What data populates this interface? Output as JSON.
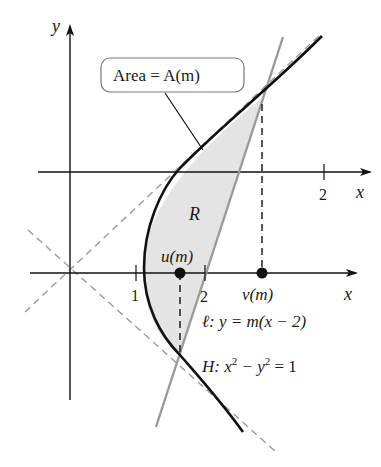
{
  "figure": {
    "axes": {
      "x_label": "x",
      "y_label": "y",
      "x_label_upper": "x"
    },
    "ticks": {
      "one": "1",
      "two": "2",
      "two_upper": "2"
    },
    "callout": {
      "text": "Area = A(m)"
    },
    "region_label": "R",
    "points": {
      "u": "u(m)",
      "v": "v(m)"
    },
    "line_label": "ℓ: y = m(x − 2)",
    "hyperbola_label": {
      "prefix": "H: x",
      "sup1": "2",
      "mid": " − y",
      "sup2": "2",
      "suffix": " = 1"
    },
    "colors": {
      "curve": "#111111",
      "line": "#9a9a9a",
      "shade": "#e4e4e4",
      "asymptote": "#9a9a9a"
    }
  }
}
